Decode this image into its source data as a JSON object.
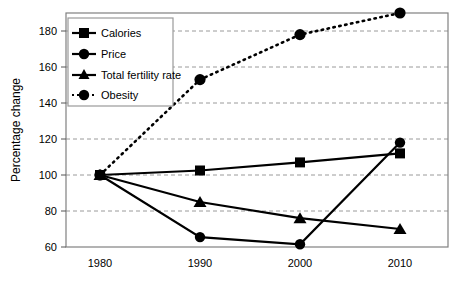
{
  "chart_data": {
    "type": "line",
    "title": "",
    "xlabel": "",
    "ylabel": "Percentage change",
    "categories": [
      "1980",
      "1990",
      "2000",
      "2010"
    ],
    "x": [
      1980,
      1990,
      2000,
      2010
    ],
    "xlim": [
      1975,
      2015
    ],
    "ylim": [
      60,
      192
    ],
    "yticks": [
      60,
      80,
      100,
      120,
      140,
      160,
      180
    ],
    "grid": true,
    "legend_position": "top-left",
    "series": [
      {
        "name": "Calories",
        "marker": "square",
        "line_style": "solid",
        "color": "#000000",
        "values": [
          100,
          102.5,
          107,
          112
        ]
      },
      {
        "name": "Price",
        "marker": "circle",
        "line_style": "solid",
        "color": "#000000",
        "values": [
          100,
          65.5,
          61.5,
          118
        ]
      },
      {
        "name": "Total fertility rate",
        "marker": "triangle",
        "line_style": "solid",
        "color": "#000000",
        "values": [
          100,
          85,
          76,
          70
        ]
      },
      {
        "name": "Obesity",
        "marker": "circle",
        "line_style": "dotted",
        "color": "#000000",
        "values": [
          100,
          153,
          178,
          190
        ]
      }
    ]
  },
  "axis": {
    "y_title": "Percentage change",
    "y_tick_labels": [
      "180",
      "160",
      "140",
      "120",
      "100",
      "80",
      "60"
    ],
    "x_tick_labels": [
      "1980",
      "1990",
      "2000",
      "2010"
    ]
  },
  "legend": {
    "items": [
      {
        "label": "Calories"
      },
      {
        "label": "Price"
      },
      {
        "label": "Total fertility rate"
      },
      {
        "label": "Obesity"
      }
    ]
  },
  "colors": {
    "plot_border": "#808080",
    "gridline": "#9a9a9a",
    "series": "#000000",
    "legend_border": "#9a9a9a",
    "background": "#ffffff"
  }
}
